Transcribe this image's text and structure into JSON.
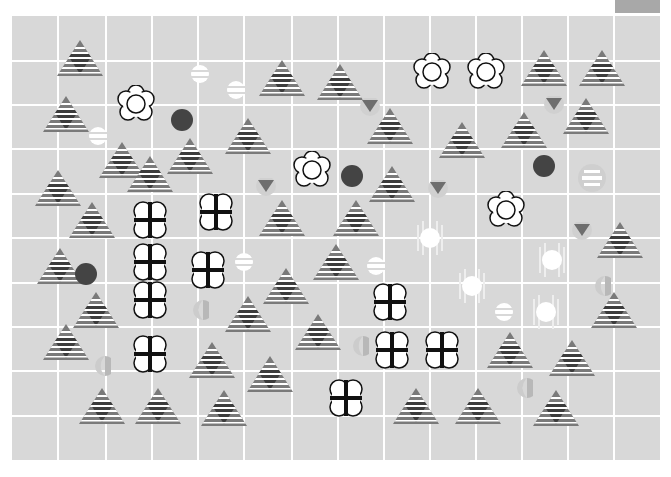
{
  "board": {
    "columns": 14,
    "rows": 10,
    "background": "#d8d8d8",
    "grid_line_color": "#ffffff",
    "v_lines": [
      0,
      46,
      94,
      140,
      186,
      232,
      280,
      326,
      372,
      418,
      464,
      510,
      556,
      602
    ],
    "h_lines": [
      45,
      89,
      133,
      178,
      222,
      267,
      311,
      355,
      400
    ]
  },
  "colors": {
    "triangle_gray": "#7a7a7a",
    "triangle_dark": "#3c3c3c",
    "dark_circle": "#444444",
    "small_triangle": "#6e6e6e",
    "half_circle": "#b8b8b8",
    "header_block": "#a8a8a8"
  },
  "pieces": {
    "striped_triangles": [
      [
        80,
        58
      ],
      [
        66,
        114
      ],
      [
        122,
        160
      ],
      [
        190,
        156
      ],
      [
        248,
        136
      ],
      [
        282,
        78
      ],
      [
        340,
        82
      ],
      [
        390,
        126
      ],
      [
        462,
        140
      ],
      [
        524,
        130
      ],
      [
        586,
        116
      ],
      [
        544,
        68
      ],
      [
        602,
        68
      ],
      [
        58,
        188
      ],
      [
        92,
        220
      ],
      [
        150,
        174
      ],
      [
        282,
        218
      ],
      [
        356,
        218
      ],
      [
        392,
        184
      ],
      [
        60,
        266
      ],
      [
        96,
        310
      ],
      [
        248,
        314
      ],
      [
        286,
        286
      ],
      [
        336,
        262
      ],
      [
        620,
        240
      ],
      [
        66,
        342
      ],
      [
        212,
        360
      ],
      [
        270,
        374
      ],
      [
        318,
        332
      ],
      [
        510,
        350
      ],
      [
        572,
        358
      ],
      [
        614,
        310
      ],
      [
        102,
        406
      ],
      [
        158,
        406
      ],
      [
        224,
        408
      ],
      [
        416,
        406
      ],
      [
        478,
        406
      ],
      [
        556,
        408
      ]
    ],
    "flowers": [
      [
        136,
        104
      ],
      [
        312,
        170
      ],
      [
        432,
        72
      ],
      [
        486,
        72
      ],
      [
        506,
        210
      ]
    ],
    "cross_clovers": [
      [
        150,
        220
      ],
      [
        216,
        212
      ],
      [
        150,
        262
      ],
      [
        208,
        270
      ],
      [
        150,
        300
      ],
      [
        390,
        302
      ],
      [
        150,
        354
      ],
      [
        392,
        350
      ],
      [
        442,
        350
      ],
      [
        346,
        398
      ]
    ],
    "dark_circles": [
      [
        182,
        120
      ],
      [
        352,
        176
      ],
      [
        544,
        166
      ],
      [
        86,
        274
      ]
    ],
    "striped_orbs": [
      [
        200,
        74
      ],
      [
        236,
        90
      ],
      [
        98,
        136
      ],
      [
        244,
        262
      ],
      [
        376,
        266
      ],
      [
        504,
        312
      ]
    ],
    "faded_striped_orbs": [
      [
        592,
        178
      ]
    ],
    "glowing_orbs": [
      [
        430,
        238
      ],
      [
        552,
        260
      ],
      [
        472,
        286
      ],
      [
        546,
        312
      ]
    ],
    "small_triangles": [
      [
        370,
        108
      ],
      [
        554,
        106
      ],
      [
        266,
        188
      ],
      [
        438,
        190
      ],
      [
        582,
        232
      ]
    ],
    "half_circles": [
      [
        200,
        310
      ],
      [
        360,
        346
      ],
      [
        102,
        366
      ],
      [
        602,
        286
      ],
      [
        524,
        388
      ]
    ]
  }
}
